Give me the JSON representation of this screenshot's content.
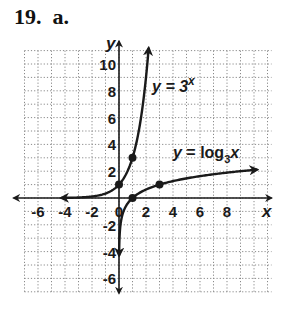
{
  "problem": {
    "label": "19.  a."
  },
  "colors": {
    "ink": "#1a1a1a",
    "grid": "#8a8a8a",
    "background": "#ffffff"
  },
  "chart_data": {
    "type": "line",
    "title": "19. a.",
    "xlabel": "x",
    "ylabel": "y",
    "xlim": [
      -7,
      11
    ],
    "ylim": [
      -7,
      11
    ],
    "grid": true,
    "grid_style": "dotted",
    "x_ticks": [
      -6,
      -4,
      -2,
      0,
      2,
      4,
      6,
      8
    ],
    "y_ticks": [
      -6,
      -4,
      -2,
      2,
      4,
      6,
      8,
      10
    ],
    "x_tick_labels": [
      "-6",
      "-4",
      "-2",
      "0",
      "2",
      "4",
      "6",
      "8"
    ],
    "y_tick_labels": [
      "-6",
      "-4",
      "-2",
      "2",
      "4",
      "6",
      "8",
      "10"
    ],
    "series": [
      {
        "name": "y = 3^x",
        "label_main": "y = 3",
        "label_sup": "x",
        "function": "3^x",
        "marked_points": [
          [
            0,
            1
          ],
          [
            1,
            3
          ]
        ],
        "domain_shown": [
          -4.3,
          2.2
        ],
        "arrows": "both"
      },
      {
        "name": "y = log_3 x",
        "label_main": "y = log",
        "label_sub": "3",
        "label_var": "x",
        "function": "log3(x)",
        "marked_points": [
          [
            1,
            0
          ],
          [
            3,
            1
          ]
        ],
        "domain_shown": [
          0.01,
          10.3
        ],
        "arrows": "both"
      }
    ]
  }
}
